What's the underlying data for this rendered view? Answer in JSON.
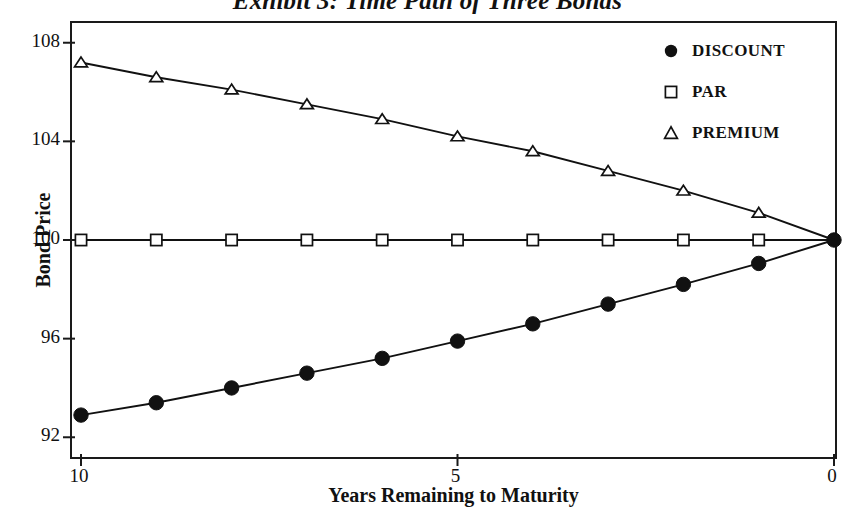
{
  "chart_data": {
    "type": "line",
    "title": "Exhibit 3: Time Path of Three Bonds",
    "xlabel": "Years Remaining to Maturity",
    "ylabel": "Bond Price",
    "xlim": [
      10,
      0
    ],
    "ylim": [
      91.2,
      108.8
    ],
    "x_reversed": true,
    "grid": false,
    "legend_position": "top-right",
    "xticks": [
      "10",
      "5",
      "0"
    ],
    "xtick_values": [
      10,
      5,
      0
    ],
    "yticks": [
      "92",
      "96",
      "100",
      "104",
      "108"
    ],
    "ytick_values": [
      92,
      96,
      100,
      104,
      108
    ],
    "x": [
      10,
      9,
      8,
      7,
      6,
      5,
      4,
      3,
      2,
      1,
      0
    ],
    "series": [
      {
        "name": "DISCOUNT",
        "marker": "filled-circle",
        "values": [
          92.9,
          93.4,
          94.0,
          94.6,
          95.2,
          95.9,
          96.6,
          97.4,
          98.2,
          99.05,
          100.0
        ]
      },
      {
        "name": "PAR",
        "marker": "open-square",
        "values": [
          100.0,
          100.0,
          100.0,
          100.0,
          100.0,
          100.0,
          100.0,
          100.0,
          100.0,
          100.0,
          100.0
        ]
      },
      {
        "name": "PREMIUM",
        "marker": "open-triangle",
        "values": [
          107.2,
          106.6,
          106.1,
          105.5,
          104.9,
          104.2,
          103.6,
          102.8,
          102.0,
          101.1,
          100.0
        ]
      }
    ]
  },
  "legend": {
    "items": [
      {
        "label": "DISCOUNT",
        "marker": "filled-circle-icon"
      },
      {
        "label": "PAR",
        "marker": "open-square-icon"
      },
      {
        "label": "PREMIUM",
        "marker": "open-triangle-icon"
      }
    ]
  },
  "axis": {
    "y_title": "Bond Price",
    "x_title": "Years Remaining to Maturity",
    "y_tick_labels": [
      "108",
      "104",
      "100",
      "96",
      "92"
    ],
    "x_tick_labels": [
      "10",
      "5",
      "0"
    ]
  },
  "colors": {
    "line": "#111111",
    "frame": "#1a1a1a",
    "background": "#ffffff",
    "text": "#111111"
  }
}
